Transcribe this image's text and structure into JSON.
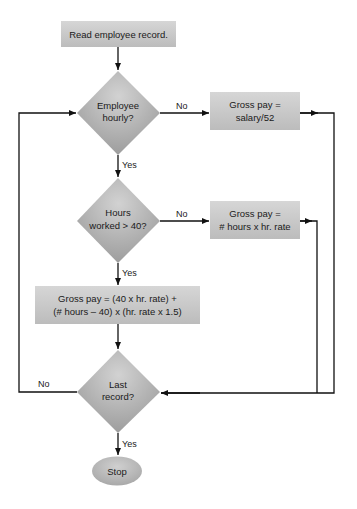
{
  "diagram": {
    "type": "flowchart",
    "nodes": {
      "read": {
        "shape": "rect",
        "text": "Read employee record."
      },
      "hourly": {
        "shape": "diamond",
        "line1": "Employee",
        "line2": "hourly?"
      },
      "salary": {
        "shape": "rect",
        "line1": "Gross pay =",
        "line2": "salary/52"
      },
      "over40": {
        "shape": "diamond",
        "line1": "Hours",
        "line2": "worked > 40?"
      },
      "regular": {
        "shape": "rect",
        "line1": "Gross pay =",
        "line2": "# hours x hr. rate"
      },
      "overtime": {
        "shape": "rect",
        "line1": "Gross pay = (40 x hr. rate) +",
        "line2": "(# hours – 40) x (hr. rate x 1.5)"
      },
      "last": {
        "shape": "diamond",
        "line1": "Last",
        "line2": "record?"
      },
      "stop": {
        "shape": "ellipse",
        "text": "Stop"
      }
    },
    "edges": {
      "hourly_no": "No",
      "hourly_yes": "Yes",
      "over40_no": "No",
      "over40_yes": "Yes",
      "last_no": "No",
      "last_yes": "Yes"
    },
    "colors": {
      "box_light": "#d4d4d4",
      "box_dark": "#bdbdbd",
      "diamond_light": "#cfcfcf",
      "diamond_dark": "#9a9a9a",
      "line": "#111111"
    }
  }
}
